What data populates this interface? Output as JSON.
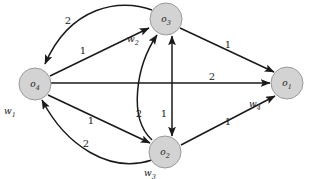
{
  "figure": {
    "type": "directed-weighted-graph",
    "background_color": "#ffffff",
    "node_fill_color": "#d3d3d3",
    "node_stroke_color": "#9a9a9a",
    "edge_color": "#1a1a1a"
  },
  "nodes": [
    {
      "id": "o3",
      "label": "o",
      "subscript": "3",
      "cx": 166,
      "cy": 19,
      "r": 16
    },
    {
      "id": "o4",
      "label": "o",
      "subscript": "4",
      "cx": 35,
      "cy": 84,
      "r": 16
    },
    {
      "id": "o1",
      "label": "o",
      "subscript": "1",
      "cx": 287,
      "cy": 83,
      "r": 16
    },
    {
      "id": "o2",
      "label": "o",
      "subscript": "2",
      "cx": 165,
      "cy": 152,
      "r": 16
    }
  ],
  "node_weights": [
    {
      "id": "w1",
      "label": "w",
      "subscript": "1",
      "x": 10,
      "y": 114,
      "for_node": "o4"
    },
    {
      "id": "w2",
      "label": "w",
      "subscript": "2",
      "x": 133,
      "y": 42,
      "for_node": "o3"
    },
    {
      "id": "w3",
      "label": "w",
      "subscript": "3",
      "x": 150,
      "y": 176,
      "for_node": "o2"
    },
    {
      "id": "w4",
      "label": "w",
      "subscript": "4",
      "x": 255,
      "y": 107,
      "for_node": "o1"
    }
  ],
  "edges": [
    {
      "id": "e-o3-o4-curved",
      "from": "o3",
      "to": "o4",
      "weight": "2",
      "style": "curved",
      "arrow": "single",
      "weight_x": 68,
      "weight_y": 24
    },
    {
      "id": "e-o4-o3-straight",
      "from": "o4",
      "to": "o3",
      "weight": "1",
      "style": "straight",
      "arrow": "single",
      "weight_x": 83,
      "weight_y": 54
    },
    {
      "id": "e-o3-o1",
      "from": "o3",
      "to": "o1",
      "weight": "1",
      "style": "straight",
      "arrow": "single",
      "weight_x": 228,
      "weight_y": 48
    },
    {
      "id": "e-o4-o1",
      "from": "o4",
      "to": "o1",
      "weight": "2",
      "style": "straight",
      "arrow": "single",
      "weight_x": 212,
      "weight_y": 83
    },
    {
      "id": "e-o2-o3-curved",
      "from": "o2",
      "to": "o3",
      "weight": "2",
      "style": "curved",
      "arrow": "single",
      "weight_x": 139,
      "weight_y": 114
    },
    {
      "id": "e-o3-o2-vertical",
      "from": "o3",
      "to": "o2",
      "weight": "1",
      "style": "straight",
      "arrow": "double",
      "weight_x": 162,
      "weight_y": 114
    },
    {
      "id": "e-o4-o2-straight",
      "from": "o4",
      "to": "o2",
      "weight": "1",
      "style": "straight",
      "arrow": "single",
      "weight_x": 91,
      "weight_y": 124
    },
    {
      "id": "e-o2-o4-curved",
      "from": "o2",
      "to": "o4",
      "weight": "2",
      "style": "curved",
      "arrow": "single",
      "weight_x": 86,
      "weight_y": 147
    },
    {
      "id": "e-o2-o1",
      "from": "o2",
      "to": "o1",
      "weight": "1",
      "style": "straight",
      "arrow": "single",
      "weight_x": 228,
      "weight_y": 125
    }
  ]
}
